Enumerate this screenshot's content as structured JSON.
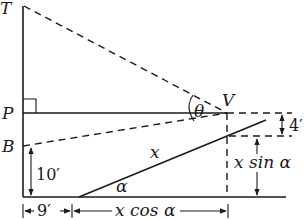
{
  "figure": {
    "type": "geometry-diagram"
  },
  "points": {
    "T": "T",
    "P": "P",
    "B": "B",
    "V": "V"
  },
  "angles": {
    "theta": "θ",
    "alpha": "α"
  },
  "labels": {
    "ramp_length": "x",
    "height_B": "10′",
    "eye_height": "4′",
    "vertical_rise": "x sin α",
    "horizontal_run": "x cos α",
    "offset": "9′"
  }
}
